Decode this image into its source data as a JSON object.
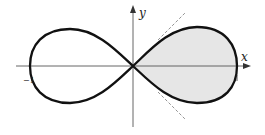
{
  "diagram": {
    "axes": {
      "x_label": "x",
      "y_label": "y"
    },
    "ticks": {
      "left": "−1",
      "right": "1"
    },
    "colors": {
      "curve": "#111111",
      "fill": "#e6e6e6",
      "axis": "#555555",
      "tangent": "#777777"
    },
    "elements": [
      "lemniscate curve",
      "shaded right loop",
      "tangent lines at origin (dashed)",
      "x-axis",
      "y-axis"
    ]
  }
}
